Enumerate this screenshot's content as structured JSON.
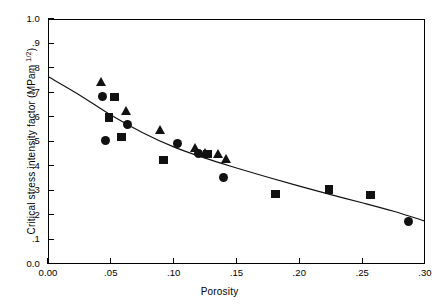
{
  "chart_data": {
    "type": "scatter",
    "title": "",
    "xlabel": "Porosity",
    "ylabel": "Critical stress intensity factor  (MPam 1/2)",
    "ylabel_main": "Critical stress intensity factor  (MPam ",
    "ylabel_sup": "1/2",
    "ylabel_close": ")",
    "xlim": [
      0.0,
      0.3
    ],
    "ylim": [
      0.0,
      1.0
    ],
    "grid": false,
    "legend": "none",
    "xticks": [
      0.0,
      0.05,
      0.1,
      0.15,
      0.2,
      0.25,
      0.3
    ],
    "xtick_labels": [
      "0.00",
      ".05",
      ".10",
      ".15",
      ".20",
      ".25",
      ".30"
    ],
    "yticks": [
      0.0,
      0.1,
      0.2,
      0.3,
      0.4,
      0.5,
      0.6,
      0.7,
      0.8,
      0.9,
      1.0
    ],
    "ytick_labels": [
      "0.0",
      ".1",
      ".2",
      ".3",
      ".4",
      ".5",
      ".6",
      ".7",
      ".8",
      ".9",
      "1.0"
    ],
    "series": [
      {
        "name": "triangle-series",
        "marker": "triangle",
        "color": "#111111",
        "points": [
          {
            "x": 0.0425,
            "y": 0.745
          },
          {
            "x": 0.0625,
            "y": 0.625
          },
          {
            "x": 0.0895,
            "y": 0.548
          },
          {
            "x": 0.1175,
            "y": 0.475
          },
          {
            "x": 0.125,
            "y": 0.455
          },
          {
            "x": 0.1355,
            "y": 0.448
          },
          {
            "x": 0.142,
            "y": 0.43
          }
        ]
      },
      {
        "name": "circle-series",
        "marker": "circle",
        "color": "#111111",
        "points": [
          {
            "x": 0.0435,
            "y": 0.682
          },
          {
            "x": 0.0455,
            "y": 0.503
          },
          {
            "x": 0.063,
            "y": 0.568
          },
          {
            "x": 0.103,
            "y": 0.49
          },
          {
            "x": 0.12,
            "y": 0.452
          },
          {
            "x": 0.14,
            "y": 0.352
          },
          {
            "x": 0.287,
            "y": 0.172
          }
        ]
      },
      {
        "name": "square-series",
        "marker": "square",
        "color": "#111111",
        "points": [
          {
            "x": 0.053,
            "y": 0.682
          },
          {
            "x": 0.0485,
            "y": 0.598
          },
          {
            "x": 0.0585,
            "y": 0.518
          },
          {
            "x": 0.092,
            "y": 0.425
          },
          {
            "x": 0.127,
            "y": 0.448
          },
          {
            "x": 0.181,
            "y": 0.285
          },
          {
            "x": 0.2235,
            "y": 0.305
          },
          {
            "x": 0.2565,
            "y": 0.282
          }
        ]
      }
    ],
    "trend_line": {
      "name": "fitted-curve",
      "color": "#111111",
      "points": [
        {
          "x": 0.0,
          "y": 0.765
        },
        {
          "x": 0.025,
          "y": 0.69
        },
        {
          "x": 0.05,
          "y": 0.608
        },
        {
          "x": 0.075,
          "y": 0.537
        },
        {
          "x": 0.1,
          "y": 0.478
        },
        {
          "x": 0.125,
          "y": 0.432
        },
        {
          "x": 0.15,
          "y": 0.392
        },
        {
          "x": 0.175,
          "y": 0.354
        },
        {
          "x": 0.2,
          "y": 0.318
        },
        {
          "x": 0.225,
          "y": 0.283
        },
        {
          "x": 0.25,
          "y": 0.25
        },
        {
          "x": 0.275,
          "y": 0.215
        },
        {
          "x": 0.3,
          "y": 0.175
        }
      ]
    }
  }
}
